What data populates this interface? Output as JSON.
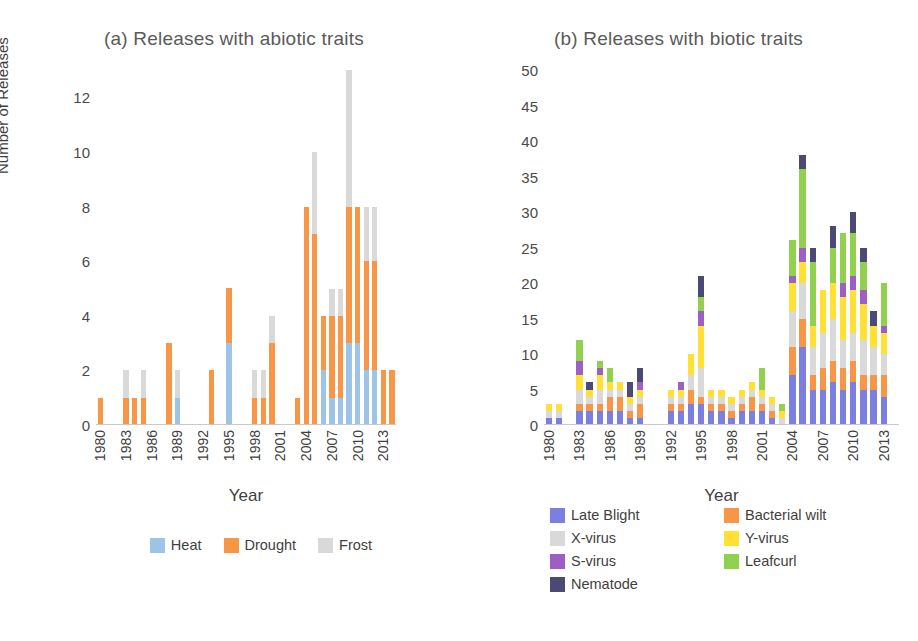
{
  "chart_data": [
    {
      "type": "bar",
      "stacked": true,
      "panel": "a",
      "title": "(a) Releases with abiotic traits",
      "xlabel": "Year",
      "ylabel": "Number of Releases",
      "ylim": [
        0,
        13
      ],
      "yticks": [
        0,
        2,
        4,
        6,
        8,
        10,
        12
      ],
      "grid": false,
      "legend_position": "bottom",
      "categories": [
        "1980",
        "1981",
        "1982",
        "1983",
        "1984",
        "1985",
        "1986",
        "1987",
        "1988",
        "1989",
        "1990",
        "1991",
        "1992",
        "1993",
        "1994",
        "1995",
        "1996",
        "1997",
        "1998",
        "1999",
        "2000",
        "2001",
        "2002",
        "2003",
        "2004",
        "2005",
        "2006",
        "2007",
        "2008",
        "2009",
        "2010",
        "2011",
        "2012",
        "2013",
        "2014"
      ],
      "tick_labels": [
        "1980",
        "",
        "",
        "1983",
        "",
        "",
        "1986",
        "",
        "",
        "1989",
        "",
        "",
        "1992",
        "",
        "",
        "1995",
        "",
        "",
        "1998",
        "",
        "",
        "2001",
        "",
        "",
        "2004",
        "",
        "",
        "2007",
        "",
        "",
        "2010",
        "",
        "",
        "2013",
        ""
      ],
      "series": [
        {
          "name": "Heat",
          "color": "#9DC3E6",
          "values": [
            0,
            0,
            0,
            0,
            0,
            0,
            0,
            0,
            0,
            1,
            0,
            0,
            0,
            0,
            0,
            3,
            0,
            0,
            0,
            0,
            0,
            0,
            0,
            0,
            0,
            0,
            2,
            1,
            1,
            3,
            3,
            2,
            2,
            0,
            0
          ]
        },
        {
          "name": "Drought",
          "color": "#F79646",
          "values": [
            1,
            0,
            0,
            1,
            1,
            1,
            0,
            0,
            3,
            0,
            0,
            0,
            0,
            2,
            0,
            2,
            0,
            0,
            1,
            1,
            3,
            0,
            0,
            1,
            8,
            7,
            2,
            3,
            3,
            5,
            5,
            4,
            4,
            2,
            2
          ]
        },
        {
          "name": "Frost",
          "color": "#D9D9D9",
          "values": [
            0,
            0,
            0,
            1,
            0,
            1,
            0,
            0,
            0,
            1,
            0,
            0,
            0,
            0,
            0,
            0,
            0,
            0,
            1,
            1,
            1,
            0,
            0,
            0,
            0,
            3,
            0,
            1,
            1,
            5,
            0,
            2,
            2,
            0,
            0
          ]
        }
      ]
    },
    {
      "type": "bar",
      "stacked": true,
      "panel": "b",
      "title": "(b) Releases with biotic traits",
      "xlabel": "Year",
      "ylabel": "",
      "ylim": [
        0,
        50
      ],
      "yticks": [
        0,
        5,
        10,
        15,
        20,
        25,
        30,
        35,
        40,
        45,
        50
      ],
      "grid": false,
      "legend_position": "bottom",
      "categories": [
        "1980",
        "1981",
        "1982",
        "1983",
        "1984",
        "1985",
        "1986",
        "1987",
        "1988",
        "1989",
        "1990",
        "1991",
        "1992",
        "1993",
        "1994",
        "1995",
        "1996",
        "1997",
        "1998",
        "1999",
        "2000",
        "2001",
        "2002",
        "2003",
        "2004",
        "2005",
        "2006",
        "2007",
        "2008",
        "2009",
        "2010",
        "2011",
        "2012",
        "2013",
        "2014"
      ],
      "tick_labels": [
        "1980",
        "",
        "",
        "1983",
        "",
        "",
        "1986",
        "",
        "",
        "1989",
        "",
        "",
        "1992",
        "",
        "",
        "1995",
        "",
        "",
        "1998",
        "",
        "",
        "2001",
        "",
        "",
        "2004",
        "",
        "",
        "2007",
        "",
        "",
        "2010",
        "",
        "",
        "2013",
        ""
      ],
      "series": [
        {
          "name": "Late Blight",
          "color": "#7B7FE0",
          "values": [
            1,
            1,
            0,
            2,
            2,
            2,
            2,
            2,
            1,
            1,
            0,
            0,
            2,
            2,
            3,
            3,
            2,
            2,
            1,
            2,
            2,
            2,
            1,
            0,
            7,
            11,
            5,
            5,
            6,
            5,
            6,
            5,
            5,
            4,
            0
          ]
        },
        {
          "name": "Bacterial wilt",
          "color": "#F79646",
          "values": [
            0,
            0,
            0,
            1,
            1,
            1,
            2,
            2,
            1,
            2,
            0,
            0,
            1,
            1,
            2,
            1,
            1,
            1,
            1,
            1,
            2,
            1,
            1,
            0,
            4,
            4,
            2,
            3,
            3,
            3,
            3,
            2,
            2,
            3,
            0
          ]
        },
        {
          "name": "X-virus",
          "color": "#D9D9D9",
          "values": [
            1,
            1,
            0,
            2,
            1,
            2,
            1,
            1,
            1,
            1,
            0,
            0,
            1,
            1,
            2,
            4,
            1,
            1,
            1,
            1,
            1,
            1,
            1,
            1,
            5,
            5,
            4,
            5,
            6,
            4,
            4,
            5,
            4,
            3,
            0
          ]
        },
        {
          "name": "Y-virus",
          "color": "#FFE033",
          "values": [
            1,
            1,
            0,
            2,
            1,
            2,
            1,
            1,
            1,
            1,
            0,
            0,
            1,
            1,
            3,
            6,
            1,
            1,
            1,
            1,
            1,
            1,
            1,
            1,
            4,
            3,
            3,
            6,
            5,
            6,
            6,
            5,
            3,
            3,
            0
          ]
        },
        {
          "name": "S-virus",
          "color": "#9C5FC4",
          "values": [
            0,
            0,
            0,
            2,
            0,
            1,
            0,
            0,
            0,
            1,
            0,
            0,
            0,
            1,
            0,
            2,
            0,
            0,
            0,
            0,
            0,
            0,
            0,
            0,
            1,
            2,
            0,
            0,
            0,
            2,
            2,
            2,
            0,
            1,
            0
          ]
        },
        {
          "name": "Leafcurl",
          "color": "#92D050",
          "values": [
            0,
            0,
            0,
            3,
            0,
            1,
            2,
            0,
            0,
            0,
            0,
            0,
            0,
            0,
            0,
            2,
            0,
            0,
            0,
            0,
            0,
            3,
            0,
            1,
            5,
            11,
            9,
            0,
            5,
            7,
            6,
            4,
            0,
            6,
            0
          ]
        },
        {
          "name": "Nematode",
          "color": "#4A4A75",
          "values": [
            0,
            0,
            0,
            0,
            1,
            0,
            0,
            0,
            2,
            2,
            0,
            0,
            0,
            0,
            0,
            3,
            0,
            0,
            0,
            0,
            0,
            0,
            0,
            0,
            0,
            2,
            2,
            0,
            3,
            0,
            3,
            2,
            2,
            0,
            0
          ]
        }
      ]
    }
  ],
  "panel_a": {
    "title": "(a) Releases with abiotic traits",
    "ylabel": "Number of Releases",
    "xlabel": "Year",
    "legend": [
      {
        "label": "Heat",
        "color": "#9DC3E6"
      },
      {
        "label": "Drought",
        "color": "#F79646"
      },
      {
        "label": "Frost",
        "color": "#D9D9D9"
      }
    ]
  },
  "panel_b": {
    "title": "(b) Releases with biotic traits",
    "ylabel": "",
    "xlabel": "Year",
    "legend": [
      {
        "label": "Late Blight",
        "color": "#7B7FE0"
      },
      {
        "label": "Bacterial wilt",
        "color": "#F79646"
      },
      {
        "label": "X-virus",
        "color": "#D9D9D9"
      },
      {
        "label": "Y-virus",
        "color": "#FFE033"
      },
      {
        "label": "S-virus",
        "color": "#9C5FC4"
      },
      {
        "label": "Leafcurl",
        "color": "#92D050"
      },
      {
        "label": "Nematode",
        "color": "#4A4A75"
      }
    ]
  }
}
